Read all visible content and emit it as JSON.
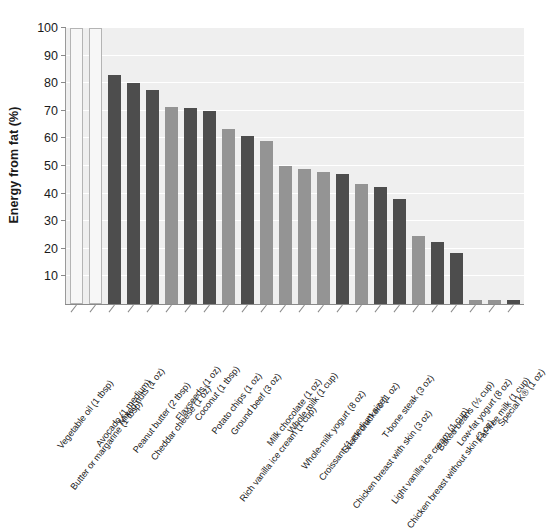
{
  "chart_data": {
    "type": "bar",
    "title": "",
    "subtitle": "",
    "xlabel": "",
    "ylabel": "Energy from fat (%)",
    "ylim": [
      0,
      100
    ],
    "yticks": [
      10,
      20,
      30,
      40,
      50,
      60,
      70,
      80,
      90,
      100
    ],
    "grid": "horizontal-only",
    "legend": "none",
    "categories": [
      "Vegetable oil (1 tbsp)",
      "Butter or margarine (1 tbsp)",
      "Avocado (1 medium)",
      "Mixed nuts (1 oz)",
      "Peanut butter (2 tbsp)",
      "Cheddar cheese (1 oz)",
      "Flaxseeds (1 oz)",
      "Coconut (1 tbsp)",
      "Potato chips (1 oz)",
      "Ground beef (3 oz)",
      "Rich vanilla ice cream (1 cup)",
      "Milk chocolate (1 oz)",
      "Whole milk (1 cup)",
      "Whole-milk yogurt (8 oz)",
      "Croissant (1 medium size)",
      "Snack crackers (1 oz)",
      "Chicken breast with skin (3 oz)",
      "T-bone steak (3 oz)",
      "Light vanilla ice cream (1 cup)",
      "Chicken breast without skin (3 oz)",
      "Baked beans (½ cup)",
      "Low-fat yogurt (8 oz)",
      "Fat-free milk (1 cup)",
      "Special K® (1 oz)"
    ],
    "values": [
      100,
      100,
      83,
      80,
      77.5,
      71.5,
      71,
      70,
      63.5,
      61,
      59,
      50,
      49,
      48,
      47,
      43.5,
      42.5,
      38,
      24.5,
      22.5,
      18.5,
      1.5,
      1.5,
      1.5
    ],
    "bar_styles": [
      "open",
      "open",
      "dark",
      "dark",
      "dark",
      "light",
      "dark",
      "dark",
      "light",
      "dark",
      "light",
      "light",
      "light",
      "light",
      "dark",
      "light",
      "dark",
      "dark",
      "light",
      "dark",
      "dark",
      "light",
      "light",
      "dark"
    ],
    "colors": {
      "bar_dark": "#4d4d4d",
      "bar_light": "#949494",
      "bar_open_fill": "#f7f7f7",
      "bar_open_stroke": "#b4b4b4",
      "plot_background": "#efefef",
      "gridline": "#ffffff",
      "axis": "#8a8a8a",
      "text": "#1a1a1a"
    }
  }
}
